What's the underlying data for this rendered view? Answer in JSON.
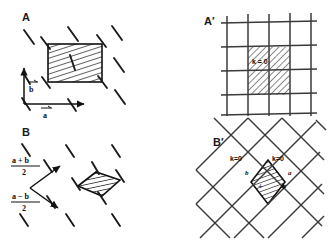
{
  "figure": {
    "background_color": "#ffffff",
    "ink_color": "#111111",
    "hatch_color": "#333333"
  },
  "panels": [
    {
      "id": "A",
      "label": "A",
      "label_x": 22,
      "label_y": 18,
      "type": "direct-lattice-rectangular",
      "cell_shape": "rectangle",
      "hatched": true,
      "vectors": [
        {
          "name": "a",
          "label": "a",
          "arrow": true,
          "direction": "horizontal"
        },
        {
          "name": "b",
          "label": "b",
          "arrow": true,
          "direction": "vertical"
        }
      ],
      "dash_marks": 9
    },
    {
      "id": "B",
      "label": "B",
      "label_x": 22,
      "label_y": 133,
      "type": "direct-lattice-centered",
      "cell_shape": "parallelogram",
      "hatched": true,
      "vectors": [
        {
          "name": "a-plus-b-over-2",
          "numerator": "a + b",
          "denominator": "2",
          "arrow": true
        },
        {
          "name": "a-minus-b-over-2",
          "numerator": "a − b",
          "denominator": "2",
          "arrow": true
        }
      ],
      "dash_marks": 8
    },
    {
      "id": "A-prime",
      "label": "A′",
      "label_x": 205,
      "label_y": 22,
      "type": "orthogonal-grid",
      "vertical_lines": 5,
      "horizontal_lines": 5,
      "hatched_region": {
        "label": "k = 0",
        "cells_wide": 2,
        "cells_tall": 2
      }
    },
    {
      "id": "B-prime",
      "label": "B′",
      "label_x": 214,
      "label_y": 143,
      "type": "diagonal-grid",
      "hatched_region": {
        "shape": "diamond"
      },
      "annotations": [
        {
          "name": "k-zero-left",
          "text": "k=0"
        },
        {
          "name": "k-zero-right",
          "text": "k=0"
        },
        {
          "name": "axis-b",
          "text": "b"
        },
        {
          "name": "axis-a",
          "text": "a"
        },
        {
          "name": "marker-plus",
          "text": "+"
        },
        {
          "name": "marker-star",
          "text": "∗"
        }
      ]
    }
  ]
}
